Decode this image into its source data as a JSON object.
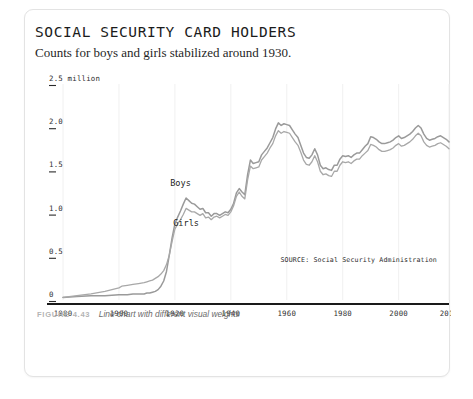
{
  "card": {
    "title": "SOCIAL SECURITY CARD HOLDERS",
    "subtitle": "Counts for boys and girls stabilized around 1930.",
    "source_note": "SOURCE: Social Security Administration"
  },
  "caption": {
    "label": "FIGURE 4.43",
    "text": "Line chart with different visual weights"
  },
  "colors": {
    "boys_line": "#9a9a9a",
    "girls_line": "#a8a8a8",
    "axis": "#1a1a1a",
    "gridline": "#f0f0f0",
    "card_border": "#e3e3e3",
    "caption_label": "#b4b4b4",
    "caption_text": "#6b6b6b"
  },
  "chart_data": {
    "type": "line",
    "title": "SOCIAL SECURITY CARD HOLDERS",
    "subtitle": "Counts for boys and girls stabilized around 1930.",
    "xlabel": "",
    "ylabel": "",
    "ylim": [
      0,
      2.5
    ],
    "xlim": [
      1880,
      2018
    ],
    "grid": "vertical-faint",
    "legend": "inline-labels",
    "y_unit": "million",
    "y_ticks": [
      0,
      0.5,
      1.0,
      1.5,
      2.0,
      2.5
    ],
    "y_tick_labels": [
      "0",
      "0.5",
      "1.0",
      "1.5",
      "2.0",
      "2.5 million"
    ],
    "x_ticks": [
      1880,
      1900,
      1920,
      1940,
      1960,
      1980,
      2000,
      2018
    ],
    "x_tick_labels": [
      "1880",
      "1900",
      "1920",
      "1940",
      "1960",
      "1980",
      "2000",
      "2018"
    ],
    "annotations": [
      {
        "text": "Boys",
        "x": 1922,
        "y": 1.32
      },
      {
        "text": "Girls",
        "x": 1924,
        "y": 0.86
      }
    ],
    "series": [
      {
        "name": "Boys",
        "x": [
          1880,
          1885,
          1890,
          1895,
          1900,
          1901,
          1903,
          1905,
          1907,
          1909,
          1910,
          1911,
          1912,
          1913,
          1914,
          1915,
          1916,
          1917,
          1918,
          1919,
          1920,
          1921,
          1922,
          1923,
          1924,
          1925,
          1926,
          1927,
          1928,
          1929,
          1930,
          1931,
          1932,
          1933,
          1934,
          1935,
          1936,
          1937,
          1938,
          1939,
          1940,
          1941,
          1942,
          1943,
          1944,
          1945,
          1946,
          1947,
          1948,
          1949,
          1950,
          1951,
          1952,
          1953,
          1954,
          1955,
          1956,
          1957,
          1958,
          1959,
          1960,
          1961,
          1962,
          1963,
          1964,
          1965,
          1966,
          1967,
          1968,
          1969,
          1970,
          1971,
          1972,
          1973,
          1974,
          1975,
          1976,
          1977,
          1978,
          1979,
          1980,
          1981,
          1982,
          1983,
          1984,
          1985,
          1986,
          1987,
          1988,
          1989,
          1990,
          1991,
          1992,
          1993,
          1994,
          1995,
          1996,
          1997,
          1998,
          1999,
          2000,
          2001,
          2002,
          2003,
          2004,
          2005,
          2006,
          2007,
          2008,
          2009,
          2010,
          2011,
          2012,
          2013,
          2014,
          2015,
          2016,
          2017,
          2018
        ],
        "y": [
          0.03,
          0.04,
          0.05,
          0.05,
          0.06,
          0.06,
          0.06,
          0.07,
          0.07,
          0.07,
          0.08,
          0.08,
          0.09,
          0.1,
          0.12,
          0.16,
          0.22,
          0.33,
          0.52,
          0.72,
          0.88,
          0.96,
          1.03,
          1.11,
          1.18,
          1.15,
          1.12,
          1.11,
          1.08,
          1.05,
          1.06,
          1.01,
          1.01,
          0.97,
          1.0,
          1.0,
          0.98,
          1.0,
          1.02,
          1.01,
          1.05,
          1.12,
          1.24,
          1.29,
          1.25,
          1.22,
          1.45,
          1.62,
          1.58,
          1.59,
          1.6,
          1.68,
          1.72,
          1.76,
          1.82,
          1.88,
          1.98,
          2.05,
          2.02,
          2.04,
          2.03,
          2.02,
          1.97,
          1.92,
          1.88,
          1.79,
          1.7,
          1.65,
          1.64,
          1.68,
          1.75,
          1.68,
          1.56,
          1.52,
          1.53,
          1.51,
          1.5,
          1.56,
          1.56,
          1.63,
          1.67,
          1.66,
          1.67,
          1.65,
          1.68,
          1.7,
          1.7,
          1.74,
          1.78,
          1.81,
          1.89,
          1.88,
          1.86,
          1.83,
          1.81,
          1.81,
          1.82,
          1.83,
          1.85,
          1.88,
          1.9,
          1.87,
          1.88,
          1.9,
          1.92,
          1.95,
          1.99,
          2.02,
          1.99,
          1.92,
          1.87,
          1.85,
          1.86,
          1.87,
          1.89,
          1.9,
          1.88,
          1.86,
          1.83
        ]
      },
      {
        "name": "Girls",
        "x": [
          1880,
          1885,
          1890,
          1895,
          1900,
          1901,
          1903,
          1905,
          1907,
          1909,
          1910,
          1911,
          1912,
          1913,
          1914,
          1915,
          1916,
          1917,
          1918,
          1919,
          1920,
          1921,
          1922,
          1923,
          1924,
          1925,
          1926,
          1927,
          1928,
          1929,
          1930,
          1931,
          1932,
          1933,
          1934,
          1935,
          1936,
          1937,
          1938,
          1939,
          1940,
          1941,
          1942,
          1943,
          1944,
          1945,
          1946,
          1947,
          1948,
          1949,
          1950,
          1951,
          1952,
          1953,
          1954,
          1955,
          1956,
          1957,
          1958,
          1959,
          1960,
          1961,
          1962,
          1963,
          1964,
          1965,
          1966,
          1967,
          1968,
          1969,
          1970,
          1971,
          1972,
          1973,
          1974,
          1975,
          1976,
          1977,
          1978,
          1979,
          1980,
          1981,
          1982,
          1983,
          1984,
          1985,
          1986,
          1987,
          1988,
          1989,
          1990,
          1991,
          1992,
          1993,
          1994,
          1995,
          1996,
          1997,
          1998,
          1999,
          2000,
          2001,
          2002,
          2003,
          2004,
          2005,
          2006,
          2007,
          2008,
          2009,
          2010,
          2011,
          2012,
          2013,
          2014,
          2015,
          2016,
          2017,
          2018
        ],
        "y": [
          0.03,
          0.05,
          0.07,
          0.1,
          0.14,
          0.16,
          0.17,
          0.18,
          0.19,
          0.2,
          0.21,
          0.22,
          0.23,
          0.25,
          0.27,
          0.3,
          0.34,
          0.41,
          0.52,
          0.68,
          0.82,
          0.88,
          0.93,
          0.99,
          1.06,
          1.04,
          1.02,
          1.02,
          1.0,
          0.98,
          1.0,
          0.95,
          0.96,
          0.93,
          0.96,
          0.97,
          0.95,
          0.97,
          0.99,
          0.98,
          1.02,
          1.09,
          1.2,
          1.25,
          1.2,
          1.17,
          1.39,
          1.55,
          1.52,
          1.53,
          1.54,
          1.62,
          1.66,
          1.7,
          1.76,
          1.81,
          1.9,
          1.96,
          1.93,
          1.95,
          1.94,
          1.93,
          1.88,
          1.83,
          1.79,
          1.71,
          1.62,
          1.57,
          1.56,
          1.6,
          1.67,
          1.6,
          1.49,
          1.45,
          1.46,
          1.44,
          1.43,
          1.49,
          1.49,
          1.56,
          1.6,
          1.59,
          1.6,
          1.58,
          1.61,
          1.63,
          1.63,
          1.67,
          1.7,
          1.73,
          1.8,
          1.79,
          1.77,
          1.74,
          1.72,
          1.72,
          1.73,
          1.74,
          1.76,
          1.79,
          1.81,
          1.78,
          1.79,
          1.81,
          1.83,
          1.86,
          1.9,
          1.93,
          1.9,
          1.83,
          1.79,
          1.77,
          1.78,
          1.79,
          1.81,
          1.82,
          1.8,
          1.78,
          1.75
        ]
      }
    ]
  }
}
